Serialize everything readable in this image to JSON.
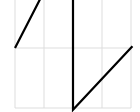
{
  "chart_data": {
    "type": "line",
    "title": "",
    "xlabel": "",
    "ylabel": "",
    "grid": true,
    "xlim": [
      0,
      4
    ],
    "ylim": [
      -1,
      0.8
    ],
    "x_gridlines": [
      0,
      1,
      2,
      3,
      4
    ],
    "y_gridlines": [
      -1,
      0
    ],
    "series": [
      {
        "name": "sawtooth",
        "points": [
          [
            0,
            0
          ],
          [
            1.7,
            1.6
          ],
          [
            2,
            1.6
          ],
          [
            2,
            -1.03
          ],
          [
            4.05,
            0.03
          ]
        ]
      }
    ],
    "colors": {
      "line": "#000000",
      "grid": "#dddddd",
      "background": "#ffffff"
    }
  }
}
